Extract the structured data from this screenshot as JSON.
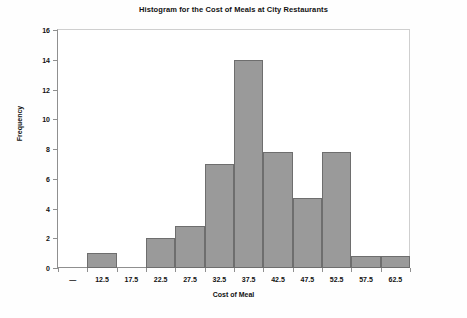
{
  "chart_data": {
    "type": "bar",
    "title": "Histogram for the Cost of Meals at City Restaurants",
    "xlabel": "Cost of Meal",
    "ylabel": "Frequency",
    "categories": [
      "—",
      "12.5",
      "17.5",
      "22.5",
      "27.5",
      "32.5",
      "37.5",
      "42.5",
      "47.5",
      "52.5",
      "57.5",
      "62.5"
    ],
    "values": [
      0,
      1,
      0,
      2,
      2.8,
      7,
      14,
      7.8,
      4.7,
      7.8,
      0.8,
      0.8
    ],
    "ylim": [
      0,
      16
    ],
    "yticks": [
      0,
      2,
      4,
      6,
      8,
      10,
      12,
      14,
      16
    ],
    "grid": false,
    "legend": null,
    "bar_color": "#9a9a9a",
    "bar_edge_color": "#6e6e6e"
  }
}
